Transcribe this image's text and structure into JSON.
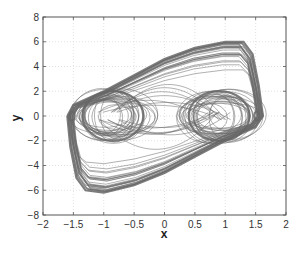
{
  "chart_data": {
    "type": "line",
    "subtype": "phase-portrait",
    "title": "",
    "xlabel": "x",
    "ylabel": "y",
    "xlim": [
      -2,
      2
    ],
    "ylim": [
      -8,
      8
    ],
    "xticks": [
      -2,
      -1.5,
      -1,
      -0.5,
      0,
      0.5,
      1,
      1.5,
      2
    ],
    "xtick_labels": [
      "-2",
      "-1.5",
      "-1",
      "-0.5",
      "0",
      "0.5",
      "1",
      "1.5",
      "2"
    ],
    "yticks": [
      -8,
      -6,
      -4,
      -2,
      0,
      2,
      4,
      6,
      8
    ],
    "ytick_labels": [
      "-8",
      "-6",
      "-4",
      "-2",
      "0",
      "2",
      "4",
      "6",
      "8"
    ],
    "grid": true,
    "legend": null,
    "series": [
      {
        "name": "trajectory",
        "color": "#6a6a6a",
        "outer_envelope": [
          {
            "x": -1.6,
            "y": 0.0
          },
          {
            "x": -1.5,
            "y": 0.9
          },
          {
            "x": -1.0,
            "y": 2.0
          },
          {
            "x": -0.5,
            "y": 3.3
          },
          {
            "x": 0.0,
            "y": 4.6
          },
          {
            "x": 0.5,
            "y": 5.5
          },
          {
            "x": 1.0,
            "y": 6.0
          },
          {
            "x": 1.3,
            "y": 6.0
          },
          {
            "x": 1.45,
            "y": 5.0
          },
          {
            "x": 1.55,
            "y": 2.5
          },
          {
            "x": 1.62,
            "y": 0.0
          },
          {
            "x": 1.5,
            "y": -0.9
          },
          {
            "x": 1.0,
            "y": -2.0
          },
          {
            "x": 0.5,
            "y": -3.3
          },
          {
            "x": 0.0,
            "y": -4.6
          },
          {
            "x": -0.5,
            "y": -5.6
          },
          {
            "x": -1.0,
            "y": -6.2
          },
          {
            "x": -1.3,
            "y": -6.0
          },
          {
            "x": -1.45,
            "y": -5.0
          },
          {
            "x": -1.55,
            "y": -2.5
          },
          {
            "x": -1.6,
            "y": 0.0
          }
        ],
        "lobes": [
          {
            "center_x": -0.85,
            "center_y": 0.0,
            "rx_range": [
              0.25,
              0.65
            ],
            "ry_range": [
              1.0,
              2.2
            ]
          },
          {
            "center_x": 0.9,
            "center_y": 0.0,
            "rx_range": [
              0.25,
              0.65
            ],
            "ry_range": [
              1.0,
              2.2
            ]
          }
        ]
      }
    ]
  }
}
